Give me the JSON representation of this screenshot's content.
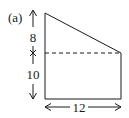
{
  "figure": {
    "label": "(a)",
    "shape": "trapezoid",
    "dimensions": {
      "upper_height": "8",
      "lower_height": "10",
      "width": "12"
    },
    "colors": {
      "stroke": "#1a1a1a",
      "background": "#ffffff"
    }
  }
}
